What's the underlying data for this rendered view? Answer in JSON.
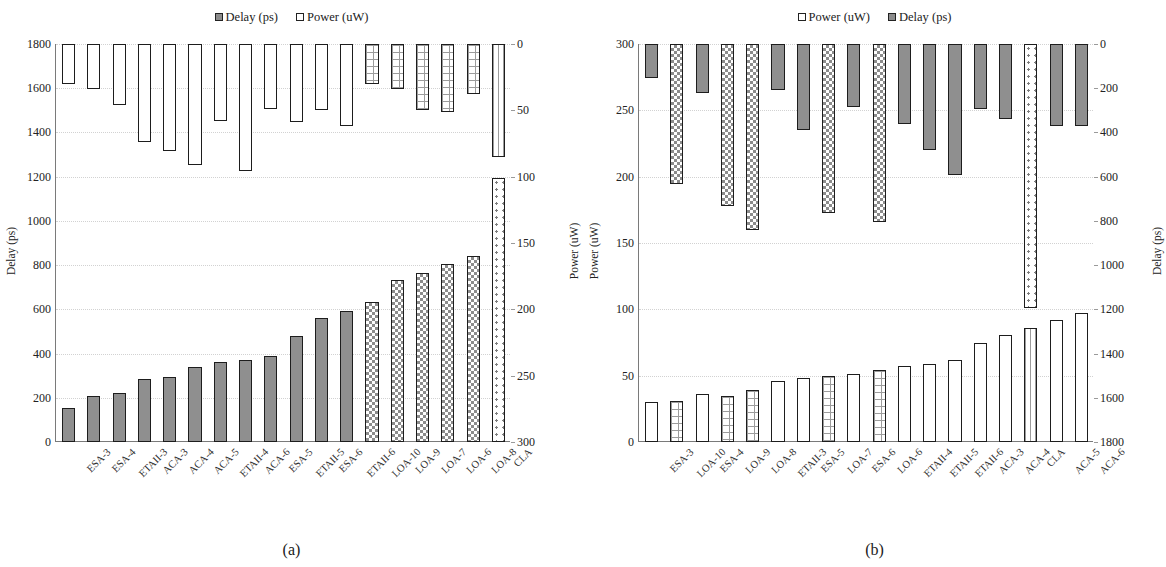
{
  "figure": {
    "panels": [
      {
        "caption": "(a)",
        "legend": [
          {
            "label": "Delay (ps)",
            "swatch": "delay"
          },
          {
            "label": "Power (uW)",
            "swatch": "power"
          }
        ],
        "chart_data": {
          "type": "bar",
          "title": "",
          "xlabel": "",
          "ylabel": "Delay (ps)",
          "y2label": "Power (uW)",
          "ylim": [
            0,
            1800
          ],
          "y2lim": [
            0,
            300
          ],
          "y_ticks": [
            0,
            200,
            400,
            600,
            800,
            1000,
            1200,
            1400,
            1600,
            1800
          ],
          "y2_ticks": [
            0,
            50,
            100,
            150,
            200,
            250,
            300
          ],
          "y2_inverted": true,
          "grid": true,
          "legend_position": "top-center",
          "categories": [
            "ESA-3",
            "ESA-4",
            "ETAII-3",
            "ACA-3",
            "ACA-4",
            "ACA-5",
            "ETAII-4",
            "ACA-6",
            "ESA-5",
            "ETAII-5",
            "ESA-6",
            "ETAII-6",
            "LOA-10",
            "LOA-9",
            "LOA-7",
            "LOA-6",
            "LOA-8",
            "CLA"
          ],
          "series": [
            {
              "name": "Delay (ps)",
              "axis": "left",
              "values": [
                153,
                207,
                222,
                284,
                296,
                341,
                362,
                373,
                391,
                478,
                561,
                591,
                634,
                733,
                764,
                803,
                843,
                1193
              ],
              "patterns": [
                "solid",
                "solid",
                "solid",
                "solid",
                "solid",
                "solid",
                "solid",
                "solid",
                "solid",
                "solid",
                "solid",
                "solid",
                "checker",
                "checker",
                "checker",
                "checker",
                "checker",
                "dots"
              ]
            },
            {
              "name": "Power (uW)",
              "axis": "right",
              "values": [
                30,
                34,
                46,
                74,
                81,
                91,
                58,
                96,
                49,
                59,
                50,
                62,
                30,
                34,
                50,
                51,
                38,
                85
              ],
              "patterns": [
                "empty",
                "empty",
                "empty",
                "empty",
                "empty",
                "empty",
                "empty",
                "empty",
                "empty",
                "empty",
                "empty",
                "empty",
                "grid",
                "grid",
                "grid",
                "grid",
                "grid",
                "vlines"
              ]
            }
          ]
        }
      },
      {
        "caption": "(b)",
        "legend": [
          {
            "label": "Power (uW)",
            "swatch": "power"
          },
          {
            "label": "Delay (ps)",
            "swatch": "delay"
          }
        ],
        "chart_data": {
          "type": "bar",
          "title": "",
          "xlabel": "",
          "ylabel": "Power (uW)",
          "y2label": "Delay (ps)",
          "ylim": [
            0,
            300
          ],
          "y2lim": [
            0,
            1800
          ],
          "y_ticks": [
            0,
            50,
            100,
            150,
            200,
            250,
            300
          ],
          "y2_ticks": [
            0,
            200,
            400,
            600,
            800,
            1000,
            1200,
            1400,
            1600,
            1800
          ],
          "y2_inverted": true,
          "grid": true,
          "legend_position": "top-center",
          "categories": [
            "ESA-3",
            "LOA-10",
            "ESA-4",
            "LOA-9",
            "LOA-8",
            "ETAII-3",
            "ESA-5",
            "LOA-7",
            "ESA-6",
            "LOA-6",
            "ETAII-4",
            "ETAII-5",
            "ETAII-6",
            "ACA-3",
            "ACA-4",
            "CLA",
            "ACA-5",
            "ACA-6"
          ],
          "series": [
            {
              "name": "Power (uW)",
              "axis": "left",
              "values": [
                30,
                31,
                36,
                35,
                39,
                46,
                48,
                50,
                51,
                54,
                57,
                59,
                62,
                75,
                81,
                86,
                92,
                97
              ],
              "patterns": [
                "empty",
                "grid",
                "empty",
                "grid",
                "grid",
                "empty",
                "empty",
                "grid",
                "empty",
                "grid",
                "empty",
                "empty",
                "empty",
                "empty",
                "empty",
                "vlines",
                "empty",
                "empty"
              ]
            },
            {
              "name": "Delay (ps)",
              "axis": "right",
              "values": [
                153,
                634,
                222,
                733,
                843,
                207,
                391,
                764,
                284,
                803,
                362,
                478,
                591,
                296,
                341,
                1193,
                373,
                373
              ],
              "patterns": [
                "solid",
                "checker",
                "solid",
                "checker",
                "checker",
                "solid",
                "solid",
                "checker",
                "solid",
                "checker",
                "solid",
                "solid",
                "solid",
                "solid",
                "solid",
                "dots",
                "solid",
                "solid"
              ]
            }
          ]
        }
      }
    ]
  }
}
